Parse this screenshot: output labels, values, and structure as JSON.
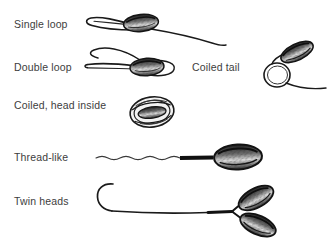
{
  "figure": {
    "background_color": "#ffffff",
    "ink_color": "#1a1a1a",
    "text_color": "#3d3d3d",
    "width": 336,
    "height": 247
  },
  "labels": {
    "single_loop": "Single loop",
    "double_loop": "Double loop",
    "coiled_head_inside": "Coiled, head inside",
    "thread_like": "Thread-like",
    "twin_heads": "Twin heads",
    "coiled_tail": "Coiled tail"
  },
  "items": [
    {
      "id": "single-loop",
      "label": "Single loop",
      "description": "Sperm with an oval head and a tail that forms one loop before extending away",
      "head_count": 1,
      "loop_count": 1
    },
    {
      "id": "double-loop",
      "label": "Double loop",
      "description": "Sperm with an oval head and a tail forming two loops",
      "head_count": 1,
      "loop_count": 2
    },
    {
      "id": "coiled-head-inside",
      "label": "Coiled, head inside",
      "description": "Tail coiled into a round mass with the head enclosed inside",
      "head_count": 1,
      "loop_count": 0
    },
    {
      "id": "thread-like",
      "label": "Thread-like",
      "description": "Oval head with a thick midpiece and a long thin wavy thread-like tail",
      "head_count": 1,
      "loop_count": 0
    },
    {
      "id": "twin-heads",
      "label": "Twin heads",
      "description": "Two oval heads attached in a V to a single long hooked tail",
      "head_count": 2,
      "loop_count": 0
    },
    {
      "id": "coiled-tail",
      "label": "Coiled tail",
      "description": "Angled oval head with the tail coiled into a ring below it",
      "head_count": 1,
      "loop_count": 1
    }
  ]
}
